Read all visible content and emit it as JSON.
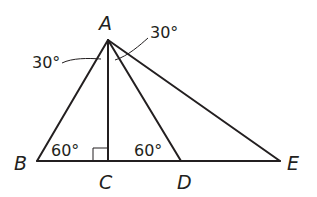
{
  "diagram": {
    "points": {
      "A": {
        "label": "A",
        "x": 108,
        "y": 40
      },
      "B": {
        "label": "B",
        "x": 37,
        "y": 161
      },
      "C": {
        "label": "C",
        "x": 108,
        "y": 161
      },
      "D": {
        "label": "D",
        "x": 181,
        "y": 161
      },
      "E": {
        "label": "E",
        "x": 280,
        "y": 161
      }
    },
    "segments": [
      "AB",
      "AC",
      "AD",
      "AE",
      "BE"
    ],
    "angles": {
      "BAC": "30°",
      "DAE": "30°",
      "ABC": "60°",
      "ADC": "60°",
      "ACB": "right angle"
    },
    "angle_labels": {
      "left_top": "30°",
      "right_top": "30°",
      "at_B": "60°",
      "at_D": "60°"
    }
  }
}
